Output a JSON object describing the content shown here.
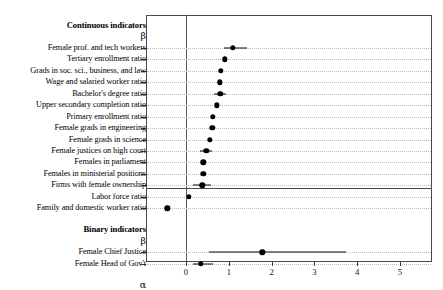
{
  "chart_data": {
    "type": "scatter",
    "title": "",
    "xlabel": "",
    "ylabel": "",
    "xlim": [
      -0.77,
      5.74
    ],
    "xticks": [
      0,
      1,
      2,
      3,
      4,
      5
    ],
    "xticklabels": [
      "0",
      "1",
      "2",
      "3",
      "4",
      "5"
    ],
    "grid": true,
    "legend": "none",
    "reference_line": 0,
    "orientation": "horizontal",
    "note": "Forest plot of point estimates with confidence intervals; rows grouped into Continuous indicators (beta) and Binary indicators (beta, alpha).",
    "sections": [
      {
        "header": "Continuous indicators",
        "param_label": "β",
        "rows": [
          {
            "label": "Female prof. and tech workers",
            "estimate": 1.1,
            "low": 0.89,
            "high": 1.43
          },
          {
            "label": "Tertiary enrollment ratio",
            "estimate": 0.91,
            "low": 0.91,
            "high": 0.91
          },
          {
            "label": "Grads in soc. sci., business, and law",
            "estimate": 0.82,
            "low": 0.82,
            "high": 0.82
          },
          {
            "label": "Wage and salaried worker ratio",
            "estimate": 0.79,
            "low": 0.79,
            "high": 0.79
          },
          {
            "label": "Bachelor's degree ratio",
            "estimate": 0.8,
            "low": 0.66,
            "high": 0.94
          },
          {
            "label": "Upper secondary completion ratio",
            "estimate": 0.72,
            "low": 0.72,
            "high": 0.72
          },
          {
            "label": "Primary enrollment ratio",
            "estimate": 0.63,
            "low": 0.63,
            "high": 0.63
          },
          {
            "label": "Female grads in engineering",
            "estimate": 0.61,
            "low": 0.61,
            "high": 0.61
          },
          {
            "label": "Female grads in science",
            "estimate": 0.56,
            "low": 0.56,
            "high": 0.56
          },
          {
            "label": "Female justices on high court",
            "estimate": 0.47,
            "low": 0.33,
            "high": 0.61
          },
          {
            "label": "Females in parliament",
            "estimate": 0.4,
            "low": 0.4,
            "high": 0.4
          },
          {
            "label": "Females in ministerial positions",
            "estimate": 0.4,
            "low": 0.4,
            "high": 0.4
          },
          {
            "label": "Firms with female ownership",
            "estimate": 0.38,
            "low": 0.17,
            "high": 0.58
          },
          {
            "label": "Labor force ratio",
            "estimate": 0.07,
            "low": 0.07,
            "high": 0.07
          },
          {
            "label": "Family and domestic worker ratio",
            "estimate": -0.44,
            "low": -0.44,
            "high": -0.44
          }
        ]
      },
      {
        "header": "Binary indicators",
        "param_label": "β",
        "rows": [
          {
            "label": "Female Chief Justice",
            "estimate": 1.78,
            "low": 0.54,
            "high": 3.74
          },
          {
            "label": "Female Head of Gov't",
            "estimate": 0.35,
            "low": 0.16,
            "high": 0.63
          }
        ]
      },
      {
        "header": "",
        "param_label": "α",
        "rows": [
          {
            "label": "Female Head of Gov't",
            "estimate": 3.25,
            "low": 3.1,
            "high": 3.42
          },
          {
            "label": "Female Chief Justice",
            "estimate": 3.32,
            "low": 2.13,
            "high": 5.47
          }
        ]
      }
    ]
  },
  "colors": {
    "marker": "#000000",
    "frame": "#4a4a4a",
    "grid": "#bdbdbd",
    "reference_line": "#5a5a5a",
    "background": "#ffffff"
  }
}
